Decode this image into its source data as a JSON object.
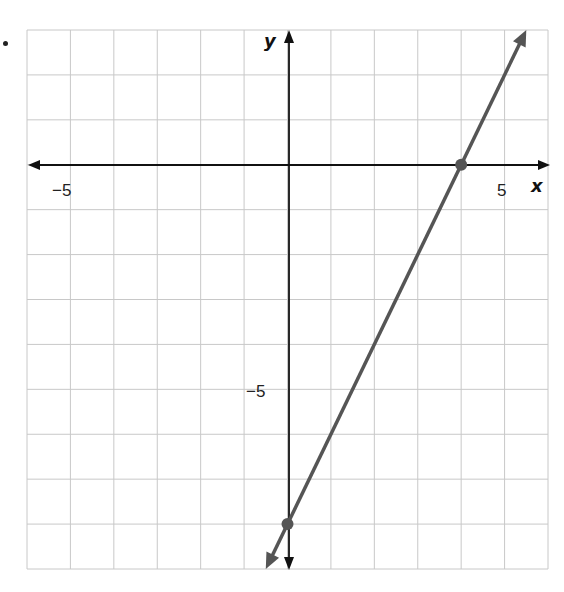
{
  "chart_data": {
    "type": "line",
    "title": "",
    "xlabel": "x",
    "ylabel": "y",
    "xlim": [
      -6,
      6
    ],
    "ylim": [
      -9,
      3
    ],
    "grid": true,
    "x_tick_labels": [
      {
        "value": -5,
        "label": "−5"
      },
      {
        "value": 5,
        "label": "5"
      }
    ],
    "y_tick_labels": [
      {
        "value": -5,
        "label": "−5"
      }
    ],
    "series": [
      {
        "name": "line",
        "equation": "y = 2x - 8",
        "color": "#555555",
        "arrows": "both",
        "x": [
          -0.5,
          5.5
        ],
        "y": [
          -9,
          3
        ]
      }
    ],
    "points": [
      {
        "x": 4,
        "y": 0,
        "label": "x-intercept"
      },
      {
        "x": 0,
        "y": -8,
        "label": "y-intercept"
      }
    ]
  },
  "labels": {
    "x_axis": "x",
    "y_axis": "y",
    "x_neg5": "−5",
    "x_pos5": "5",
    "y_neg5": "−5"
  },
  "colors": {
    "grid": "#c8c8c8",
    "axis": "#111111",
    "line": "#555555",
    "point": "#555555"
  }
}
